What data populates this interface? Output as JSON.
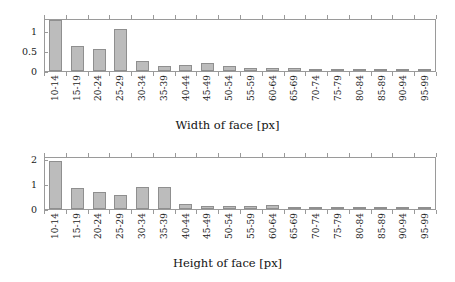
{
  "figure": {
    "background": "#ffffff",
    "bar_fill": "#bcbcbc",
    "bar_stroke": "#8f8f8f",
    "axis_color": "#9a9a9a",
    "text_color": "#1a1a1a"
  },
  "charts": [
    {
      "id": "width-of-face",
      "xlabel": "Width of face [px]",
      "ytick_labels": [
        "0",
        "0.5",
        "1"
      ]
    },
    {
      "id": "height-of-face",
      "xlabel": "Height of face [px]",
      "ytick_labels": [
        "0",
        "1",
        "2"
      ]
    }
  ],
  "chart_data": [
    {
      "type": "bar",
      "title": "",
      "xlabel": "Width of face [px]",
      "ylabel": "",
      "grid": false,
      "legend": null,
      "ylim": [
        0,
        1.33
      ],
      "yticks": [
        0,
        0.5,
        1
      ],
      "ytick_labels": [
        "0",
        "0.5",
        "1"
      ],
      "categories": [
        "10-14",
        "15-19",
        "20-24",
        "25-29",
        "30-34",
        "35-39",
        "40-44",
        "45-49",
        "50-54",
        "55-59",
        "60-64",
        "65-69",
        "70-74",
        "75-79",
        "80-84",
        "85-89",
        "90-94",
        "95-99"
      ],
      "values": [
        1.28,
        0.63,
        0.56,
        1.05,
        0.26,
        0.12,
        0.14,
        0.19,
        0.12,
        0.07,
        0.07,
        0.07,
        0.05,
        0.05,
        0.05,
        0.05,
        0.06,
        0.03
      ]
    },
    {
      "type": "bar",
      "title": "",
      "xlabel": "Height of face [px]",
      "ylabel": "",
      "grid": false,
      "legend": null,
      "ylim": [
        0,
        2.1
      ],
      "yticks": [
        0,
        1,
        2
      ],
      "ytick_labels": [
        "0",
        "1",
        "2"
      ],
      "categories": [
        "10-14",
        "15-19",
        "20-24",
        "25-29",
        "30-34",
        "35-39",
        "40-44",
        "45-49",
        "50-54",
        "55-59",
        "60-64",
        "65-69",
        "70-74",
        "75-79",
        "80-84",
        "85-89",
        "90-94",
        "95-99"
      ],
      "values": [
        1.9,
        0.84,
        0.66,
        0.56,
        0.89,
        0.86,
        0.21,
        0.1,
        0.11,
        0.11,
        0.15,
        0.09,
        0.05,
        0.05,
        0.06,
        0.06,
        0.06,
        0.05
      ]
    }
  ]
}
